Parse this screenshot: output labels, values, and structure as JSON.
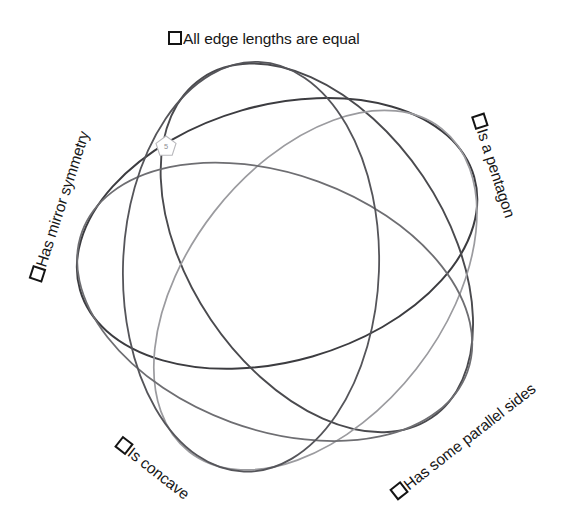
{
  "diagram": {
    "type": "venn-5-set",
    "title_absent": true,
    "background": "#ffffff",
    "center": {
      "x": 287,
      "y": 268
    },
    "labels": [
      {
        "id": "all-edge-lengths-are-equal",
        "text": "All edge lengths are equal",
        "checkbox": "empty-checkbox",
        "checked": false,
        "x": 168,
        "y": 31,
        "rotation_deg": 0,
        "curve_color": "#3c3c40"
      },
      {
        "id": "is-a-pentagon",
        "text": "Is a pentagon",
        "checkbox": "empty-checkbox",
        "checked": false,
        "x": 477,
        "y": 107,
        "rotation_deg": 72,
        "curve_color": "#4a4a4e"
      },
      {
        "id": "has-some-parallel-sides",
        "text": "Has some parallel sides",
        "checkbox": "empty-checkbox",
        "checked": false,
        "x": 394,
        "y": 488,
        "rotation_deg": -38,
        "curve_color": "#9b9b9f"
      },
      {
        "id": "is-concave",
        "text": "Is concave",
        "checkbox": "empty-checkbox",
        "checked": false,
        "x": 118,
        "y": 434,
        "rotation_deg": 38,
        "curve_color": "#6e6e72"
      },
      {
        "id": "has-mirror-symmetry",
        "text": "Has mirror symmetry",
        "checkbox": "empty-checkbox",
        "checked": false,
        "x": 36,
        "y": 273,
        "rotation_deg": -72,
        "curve_color": "#55555a"
      }
    ],
    "region_markers": [
      {
        "id": "pentagon-5",
        "shape": "pentagon-icon",
        "value": "5",
        "x": 154,
        "y": 134,
        "size": 24,
        "stroke": "#b8b8bc",
        "text_color": "#8d8d91"
      }
    ],
    "curves": [
      {
        "id": "curve-all-edge-lengths-are-equal",
        "color": "#3c3c40",
        "width": 2.0,
        "rotation_deg": 0
      },
      {
        "id": "curve-is-a-pentagon",
        "color": "#4a4a4e",
        "width": 1.9,
        "rotation_deg": 72
      },
      {
        "id": "curve-has-some-parallel-sides",
        "color": "#9b9b9f",
        "width": 1.7,
        "rotation_deg": 144
      },
      {
        "id": "curve-is-concave",
        "color": "#6e6e72",
        "width": 1.8,
        "rotation_deg": 216
      },
      {
        "id": "curve-has-mirror-symmetry",
        "color": "#55555a",
        "width": 1.8,
        "rotation_deg": 288
      }
    ]
  }
}
